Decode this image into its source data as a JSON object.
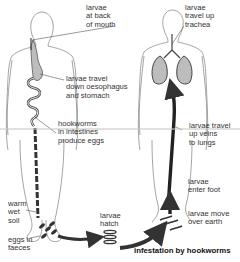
{
  "diagram": {
    "title": "infestation by hookworms",
    "colors": {
      "outline": "#9a9a9a",
      "arrow": "#333333",
      "organ_fill": "#bdbdbd",
      "text": "#333333"
    },
    "figures": [
      {
        "name": "left-body",
        "organs": [
          "oesophagus",
          "stomach",
          "intestines"
        ]
      },
      {
        "name": "right-body",
        "organs": [
          "trachea",
          "lungs",
          "veins"
        ]
      }
    ],
    "labels": {
      "larvae_mouth": "larvae\nat back\nof mouth",
      "larvae_oesophagus": "larvae travel\ndown oesophagus\nand stomach",
      "hookworms_intestines": "hookworms\nin intestines\nproduce eggs",
      "warm_soil": "warm\nwet\nsoil",
      "eggs_faeces": "eggs in\nfaeces",
      "larvae_hatch": "larvae\nhatch",
      "larvae_trachea": "larvae\ntravel up\ntrachea",
      "larvae_veins": "larvae travel\nup veins\nto lungs",
      "larvae_foot": "larvae\nenter foot",
      "larvae_earth": "larvae move\nover earth"
    }
  }
}
